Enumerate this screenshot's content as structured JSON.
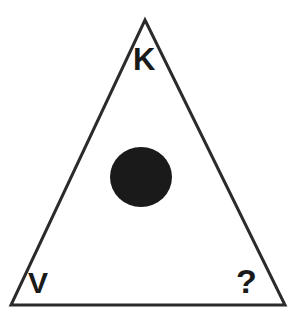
{
  "figure": {
    "background_color": "#ffffff",
    "stroke_color": "#2b2b2b",
    "fill_color": "#1a1a1a",
    "stroke_width": 3,
    "canvas": {
      "width": 295,
      "height": 319
    },
    "triangle": {
      "name": "outline-triangle",
      "apex": {
        "x": 145,
        "y": 20
      },
      "bottom_left": {
        "x": 11,
        "y": 305
      },
      "bottom_right": {
        "x": 285,
        "y": 305
      },
      "filled": false
    },
    "disc": {
      "name": "center-disc",
      "cx": 141,
      "cy": 177,
      "r": 31,
      "filled": true,
      "color": "#1a1a1a"
    },
    "labels": [
      {
        "id": "apex",
        "text": "K",
        "position": "top-center"
      },
      {
        "id": "bottom-left",
        "text": "V",
        "position": "bottom-left"
      },
      {
        "id": "bottom-right",
        "text": "?",
        "position": "bottom-right"
      }
    ]
  }
}
